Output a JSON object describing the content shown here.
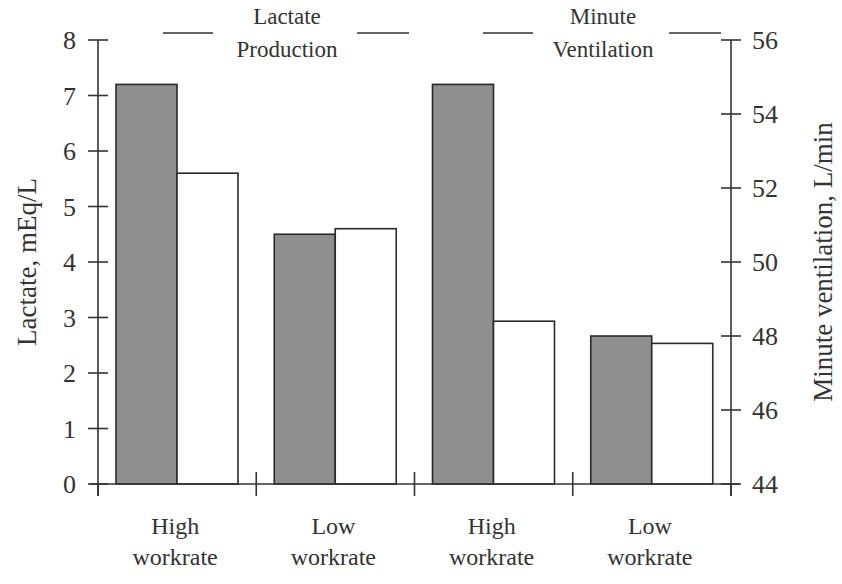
{
  "chart_data": {
    "type": "bar",
    "title": "",
    "categories": [
      "High workrate",
      "Low workrate",
      "High workrate",
      "Low workrate"
    ],
    "category_lines": [
      [
        "High",
        "workrate"
      ],
      [
        "Low",
        "workrate"
      ],
      [
        "High",
        "workrate"
      ],
      [
        "Low",
        "workrate"
      ]
    ],
    "groups": [
      {
        "name": "Lactate Production",
        "axis": "left",
        "legend_lines": [
          "Lactate",
          "Production"
        ],
        "categories": [
          "High workrate",
          "Low workrate"
        ],
        "series": [
          {
            "name": "Shaded",
            "fill": "#8f8f8f",
            "values": [
              7.2,
              4.5
            ]
          },
          {
            "name": "Open",
            "fill": "#ffffff",
            "values": [
              5.6,
              4.6
            ]
          }
        ]
      },
      {
        "name": "Minute Ventilation",
        "axis": "right",
        "legend_lines": [
          "Minute",
          "Ventilation"
        ],
        "categories": [
          "High workrate",
          "Low workrate"
        ],
        "series": [
          {
            "name": "Shaded",
            "fill": "#8f8f8f",
            "values": [
              54.8,
              48.0
            ]
          },
          {
            "name": "Open",
            "fill": "#ffffff",
            "values": [
              48.4,
              47.8
            ]
          }
        ]
      }
    ],
    "xlabel": "",
    "ylabel": "Lactate, mEq/L",
    "ylim": [
      0,
      8
    ],
    "yticks": [
      0,
      1,
      2,
      3,
      4,
      5,
      6,
      7,
      8
    ],
    "y2label": "Minute ventilation, L/min",
    "y2lim": [
      44,
      56
    ],
    "y2ticks": [
      44,
      46,
      48,
      50,
      52,
      54,
      56
    ],
    "grid": false,
    "legend_position": "top"
  },
  "colors": {
    "shaded_bar": "#8f8f8f",
    "open_bar": "#ffffff",
    "ink": "#333333"
  }
}
